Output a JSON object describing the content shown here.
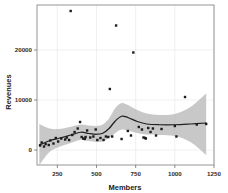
{
  "chart_data": {
    "type": "scatter",
    "title": "",
    "xlabel": "Members",
    "ylabel": "Revenues",
    "xlim": [
      120,
      1250
    ],
    "ylim": [
      -3000,
      29000
    ],
    "xticks": [
      250,
      500,
      750,
      1000,
      1250
    ],
    "yticks": [
      0,
      10000,
      20000
    ],
    "xtick_labels": [
      "250",
      "500",
      "750",
      "1000",
      "1250"
    ],
    "ytick_labels": [
      "0",
      "10000",
      "20000"
    ],
    "grid": true,
    "legend": "none",
    "smoother": "loess with 95% confidence band",
    "colors": {
      "point": "#1b1b1b",
      "line": "#231f20",
      "band": "#b3b3b3",
      "grid": "#e9e9e9",
      "frame": "#8a8a8a"
    },
    "points": [
      {
        "x": 140,
        "y": 900
      },
      {
        "x": 150,
        "y": 1500
      },
      {
        "x": 165,
        "y": 700
      },
      {
        "x": 175,
        "y": 1200
      },
      {
        "x": 195,
        "y": 1000
      },
      {
        "x": 205,
        "y": 1900
      },
      {
        "x": 225,
        "y": 1300
      },
      {
        "x": 240,
        "y": 2400
      },
      {
        "x": 255,
        "y": 1700
      },
      {
        "x": 275,
        "y": 2300
      },
      {
        "x": 300,
        "y": 2100
      },
      {
        "x": 310,
        "y": 2500
      },
      {
        "x": 325,
        "y": 2000
      },
      {
        "x": 335,
        "y": 27800
      },
      {
        "x": 345,
        "y": 3000
      },
      {
        "x": 360,
        "y": 3600
      },
      {
        "x": 380,
        "y": 4300
      },
      {
        "x": 395,
        "y": 5600
      },
      {
        "x": 405,
        "y": 2600
      },
      {
        "x": 415,
        "y": 2300
      },
      {
        "x": 425,
        "y": 2200
      },
      {
        "x": 430,
        "y": 2600
      },
      {
        "x": 440,
        "y": 3900
      },
      {
        "x": 460,
        "y": 2500
      },
      {
        "x": 480,
        "y": 2700
      },
      {
        "x": 495,
        "y": 4100
      },
      {
        "x": 505,
        "y": 2000
      },
      {
        "x": 525,
        "y": 2400
      },
      {
        "x": 545,
        "y": 2000
      },
      {
        "x": 560,
        "y": 2700
      },
      {
        "x": 575,
        "y": 2600
      },
      {
        "x": 585,
        "y": 12200
      },
      {
        "x": 600,
        "y": 2700
      },
      {
        "x": 625,
        "y": 24900
      },
      {
        "x": 660,
        "y": 2200
      },
      {
        "x": 700,
        "y": 3800
      },
      {
        "x": 720,
        "y": 2900
      },
      {
        "x": 735,
        "y": 19500
      },
      {
        "x": 770,
        "y": 4600
      },
      {
        "x": 790,
        "y": 4100
      },
      {
        "x": 800,
        "y": 2500
      },
      {
        "x": 810,
        "y": 2400
      },
      {
        "x": 815,
        "y": 2300
      },
      {
        "x": 830,
        "y": 4400
      },
      {
        "x": 845,
        "y": 3600
      },
      {
        "x": 860,
        "y": 4300
      },
      {
        "x": 880,
        "y": 2900
      },
      {
        "x": 915,
        "y": 4200
      },
      {
        "x": 1000,
        "y": 4800
      },
      {
        "x": 1010,
        "y": 2700
      },
      {
        "x": 1065,
        "y": 10600
      },
      {
        "x": 1140,
        "y": 5100
      },
      {
        "x": 1200,
        "y": 5200
      }
    ],
    "fit_curve": [
      {
        "x": 135,
        "y": 1000
      },
      {
        "x": 200,
        "y": 1850
      },
      {
        "x": 260,
        "y": 2350
      },
      {
        "x": 330,
        "y": 2950
      },
      {
        "x": 400,
        "y": 3550
      },
      {
        "x": 450,
        "y": 3300
      },
      {
        "x": 500,
        "y": 3150
      },
      {
        "x": 540,
        "y": 3350
      },
      {
        "x": 580,
        "y": 4300
      },
      {
        "x": 620,
        "y": 5800
      },
      {
        "x": 660,
        "y": 6750
      },
      {
        "x": 700,
        "y": 6500
      },
      {
        "x": 760,
        "y": 5700
      },
      {
        "x": 820,
        "y": 5200
      },
      {
        "x": 900,
        "y": 5050
      },
      {
        "x": 1000,
        "y": 5050
      },
      {
        "x": 1100,
        "y": 5200
      },
      {
        "x": 1200,
        "y": 5400
      }
    ],
    "ci_upper": [
      {
        "x": 135,
        "y": 5200
      },
      {
        "x": 200,
        "y": 4300
      },
      {
        "x": 260,
        "y": 4200
      },
      {
        "x": 330,
        "y": 4600
      },
      {
        "x": 400,
        "y": 5100
      },
      {
        "x": 450,
        "y": 4900
      },
      {
        "x": 500,
        "y": 4800
      },
      {
        "x": 540,
        "y": 5100
      },
      {
        "x": 580,
        "y": 6300
      },
      {
        "x": 620,
        "y": 8400
      },
      {
        "x": 660,
        "y": 9400
      },
      {
        "x": 700,
        "y": 9000
      },
      {
        "x": 760,
        "y": 8000
      },
      {
        "x": 820,
        "y": 7300
      },
      {
        "x": 900,
        "y": 7000
      },
      {
        "x": 1000,
        "y": 7200
      },
      {
        "x": 1100,
        "y": 8600
      },
      {
        "x": 1200,
        "y": 11300
      }
    ],
    "ci_lower": [
      {
        "x": 135,
        "y": -3000
      },
      {
        "x": 200,
        "y": -400
      },
      {
        "x": 260,
        "y": 600
      },
      {
        "x": 330,
        "y": 1350
      },
      {
        "x": 400,
        "y": 2050
      },
      {
        "x": 450,
        "y": 1800
      },
      {
        "x": 500,
        "y": 1600
      },
      {
        "x": 540,
        "y": 1700
      },
      {
        "x": 580,
        "y": 2400
      },
      {
        "x": 620,
        "y": 3400
      },
      {
        "x": 660,
        "y": 4100
      },
      {
        "x": 700,
        "y": 3900
      },
      {
        "x": 760,
        "y": 3400
      },
      {
        "x": 820,
        "y": 3100
      },
      {
        "x": 900,
        "y": 3000
      },
      {
        "x": 1000,
        "y": 2800
      },
      {
        "x": 1100,
        "y": 1600
      },
      {
        "x": 1200,
        "y": -1000
      }
    ]
  }
}
